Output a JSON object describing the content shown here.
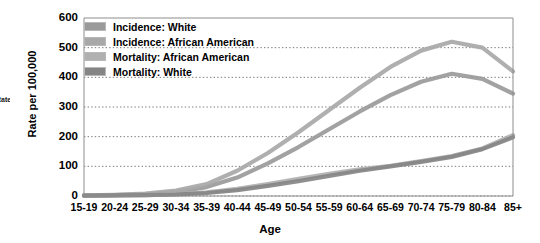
{
  "edge_fragment": "Rate",
  "chart_data": {
    "type": "line",
    "title": "",
    "xlabel": "Age",
    "ylabel": "Rate per 100,000",
    "ylim": [
      0,
      600
    ],
    "yticks": [
      0,
      100,
      200,
      300,
      400,
      500,
      600
    ],
    "grid": true,
    "legend_position": "top-left",
    "categories": [
      "15-19",
      "20-24",
      "25-29",
      "30-34",
      "35-39",
      "40-44",
      "45-49",
      "50-54",
      "55-59",
      "60-64",
      "65-69",
      "70-74",
      "75-79",
      "80-84",
      "85+"
    ],
    "series": [
      {
        "name": "Incidence: White",
        "color": "#9a9a9a",
        "values": [
          2,
          3,
          6,
          14,
          30,
          62,
          110,
          165,
          225,
          285,
          340,
          385,
          412,
          395,
          345
        ]
      },
      {
        "name": "Incidence: African American",
        "color": "#a8a8a8",
        "values": [
          2,
          4,
          8,
          18,
          40,
          85,
          145,
          215,
          290,
          365,
          435,
          490,
          520,
          500,
          420
        ]
      },
      {
        "name": "Mortality: African American",
        "color": "#b0b0b0",
        "values": [
          1,
          2,
          3,
          6,
          12,
          24,
          40,
          58,
          75,
          90,
          102,
          118,
          135,
          160,
          205
        ]
      },
      {
        "name": "Mortality: White",
        "color": "#858585",
        "values": [
          1,
          2,
          3,
          5,
          10,
          20,
          34,
          50,
          68,
          85,
          100,
          115,
          132,
          158,
          198
        ]
      }
    ]
  }
}
